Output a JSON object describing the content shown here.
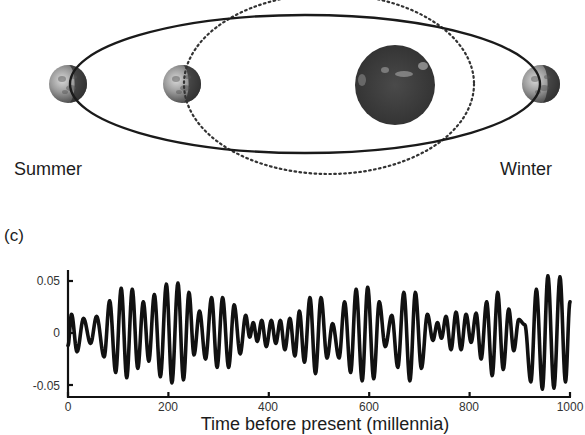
{
  "orbit_diagram": {
    "labels": {
      "summer": "Summer",
      "winter": "Winter"
    },
    "colors": {
      "orbit_line": "#1a1a1a",
      "sun": "#3a3a3a",
      "earth_light": "#b8b8b8",
      "earth_dark": "#2e2e2e"
    },
    "elliptical_orbit": {
      "style": "solid",
      "cx": 305,
      "cy": 84,
      "rx": 235,
      "ry": 69
    },
    "circular_orbit": {
      "style": "dotted",
      "cx": 329,
      "cy": 84,
      "rx": 145,
      "ry": 90
    },
    "sun": {
      "cx": 395,
      "cy": 85,
      "r": 40
    },
    "earths": [
      {
        "name": "earth-summer-elliptical",
        "cx": 68,
        "cy": 84,
        "r": 19
      },
      {
        "name": "earth-summer-circular",
        "cx": 182,
        "cy": 84,
        "r": 19
      },
      {
        "name": "earth-winter",
        "cx": 541,
        "cy": 84,
        "r": 19
      }
    ]
  },
  "panel_label": "(c)",
  "chart_data": {
    "type": "line",
    "title": "",
    "xlabel": "Time before present (millennia)",
    "ylabel": "",
    "xlim": [
      0,
      1000
    ],
    "ylim": [
      -0.06,
      0.06
    ],
    "xticks": [
      0,
      200,
      400,
      600,
      800,
      1000
    ],
    "xtick_labels": [
      "0",
      "200",
      "400",
      "600",
      "800",
      "1000"
    ],
    "yticks": [
      0.05,
      0,
      -0.05
    ],
    "ytick_labels": [
      "0.05",
      "0",
      "-0.05"
    ],
    "grid": false,
    "legend": null,
    "series": [
      {
        "name": "precession index",
        "color": "#111111",
        "extrema": [
          [
            0,
            -0.012
          ],
          [
            7,
            0.018
          ],
          [
            18,
            -0.018
          ],
          [
            31,
            0.014
          ],
          [
            45,
            -0.01
          ],
          [
            57,
            0.016
          ],
          [
            72,
            -0.023
          ],
          [
            83,
            0.031
          ],
          [
            95,
            -0.038
          ],
          [
            106,
            0.043
          ],
          [
            117,
            -0.043
          ],
          [
            128,
            0.042
          ],
          [
            139,
            -0.034
          ],
          [
            150,
            0.03
          ],
          [
            161,
            -0.027
          ],
          [
            172,
            0.037
          ],
          [
            184,
            -0.042
          ],
          [
            196,
            0.047
          ],
          [
            207,
            -0.048
          ],
          [
            219,
            0.048
          ],
          [
            230,
            -0.045
          ],
          [
            241,
            0.039
          ],
          [
            251,
            -0.021
          ],
          [
            262,
            0.021
          ],
          [
            274,
            -0.025
          ],
          [
            286,
            0.034
          ],
          [
            297,
            -0.033
          ],
          [
            308,
            0.034
          ],
          [
            320,
            -0.033
          ],
          [
            331,
            0.027
          ],
          [
            343,
            -0.02
          ],
          [
            354,
            0.017
          ],
          [
            362,
            -0.004
          ],
          [
            369,
            0.01
          ],
          [
            377,
            -0.008
          ],
          [
            386,
            0.012
          ],
          [
            395,
            -0.013
          ],
          [
            405,
            0.012
          ],
          [
            414,
            -0.01
          ],
          [
            423,
            0.012
          ],
          [
            432,
            -0.016
          ],
          [
            442,
            0.014
          ],
          [
            452,
            -0.022
          ],
          [
            461,
            0.021
          ],
          [
            471,
            -0.028
          ],
          [
            482,
            0.034
          ],
          [
            493,
            -0.039
          ],
          [
            504,
            0.034
          ],
          [
            516,
            -0.024
          ],
          [
            527,
            0.009
          ],
          [
            540,
            -0.024
          ],
          [
            551,
            0.03
          ],
          [
            563,
            -0.038
          ],
          [
            574,
            0.042
          ],
          [
            586,
            -0.046
          ],
          [
            597,
            0.044
          ],
          [
            609,
            -0.044
          ],
          [
            620,
            0.03
          ],
          [
            632,
            -0.013
          ],
          [
            645,
            0.017
          ],
          [
            657,
            -0.033
          ],
          [
            669,
            0.039
          ],
          [
            681,
            -0.046
          ],
          [
            692,
            0.039
          ],
          [
            704,
            -0.034
          ],
          [
            716,
            0.018
          ],
          [
            727,
            -0.007
          ],
          [
            736,
            0.01
          ],
          [
            744,
            -0.005
          ],
          [
            753,
            0.016
          ],
          [
            763,
            -0.016
          ],
          [
            773,
            0.02
          ],
          [
            783,
            -0.016
          ],
          [
            793,
            0.018
          ],
          [
            803,
            -0.009
          ],
          [
            813,
            0.019
          ],
          [
            823,
            -0.025
          ],
          [
            834,
            0.03
          ],
          [
            845,
            -0.041
          ],
          [
            856,
            0.039
          ],
          [
            867,
            -0.035
          ],
          [
            878,
            0.023
          ],
          [
            888,
            -0.017
          ],
          [
            898,
            0.013
          ],
          [
            910,
            0.008
          ],
          [
            922,
            -0.047
          ],
          [
            933,
            0.042
          ],
          [
            945,
            -0.054
          ],
          [
            956,
            0.055
          ],
          [
            968,
            -0.053
          ],
          [
            980,
            0.054
          ],
          [
            991,
            -0.047
          ],
          [
            1000,
            0.03
          ]
        ]
      }
    ]
  }
}
